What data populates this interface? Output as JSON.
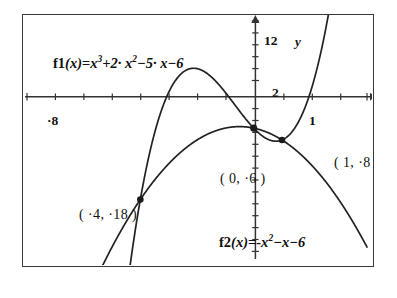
{
  "figure": {
    "background_color": "#ffffff",
    "frame_color": "#3a3a3a",
    "curve_color": "#222222"
  },
  "equations": {
    "f1_name": "f1",
    "f1_arg": "(x)",
    "f1_eq": "=",
    "f1_body_1": "x",
    "f1_body_1_exp": "3",
    "f1_body_2": "+2· x",
    "f1_body_2_exp": "2",
    "f1_body_3": "−5· x−6",
    "f1_plain": "f1(x)=x^3+2·x^2−5·x−6",
    "f2_name": "f2",
    "f2_arg": "(x)",
    "f2_eq": "=",
    "f2_body_1": "-x",
    "f2_body_1_exp": "2",
    "f2_body_2": "−x−6",
    "f2_plain": "f2(x)=-x^2−x−6"
  },
  "axes": {
    "x_name": "x",
    "y_name": "y",
    "x_min_label": "·8",
    "x_max_label": "4",
    "x_one_label": "1",
    "y_max_label": "12",
    "y_two_label": "2",
    "y_min_label": "·28"
  },
  "point_labels": {
    "a": "( ·4, ·18 )",
    "b": "( 0, ·6 )",
    "c": "( 1, ·8 )"
  },
  "chart_data": {
    "type": "line",
    "title": "",
    "xlabel": "x",
    "ylabel": "y",
    "xlim": [
      -8,
      4
    ],
    "ylim": [
      -28,
      12
    ],
    "grid": false,
    "legend": "none",
    "xticks": [
      -8,
      -7,
      -6,
      -5,
      -4,
      -3,
      -2,
      -1,
      0,
      1,
      2,
      3,
      4
    ],
    "xtick_labels_shown": [
      "·8",
      "1",
      "4"
    ],
    "yticks": [
      -28,
      -26,
      -24,
      -22,
      -20,
      -18,
      -16,
      -14,
      -12,
      -10,
      -8,
      -6,
      -4,
      -2,
      0,
      2,
      4,
      6,
      8,
      10,
      12
    ],
    "ytick_labels_shown": [
      "12",
      "2",
      "·28"
    ],
    "series": [
      {
        "name": "f1(x)=x^3+2·x^2−5·x−6",
        "kind": "cubic",
        "coefficients": {
          "a": 1,
          "b": 2,
          "c": -5,
          "d": -6
        },
        "roots": [
          -3,
          -1,
          2
        ],
        "local_max_x": -2.12,
        "local_max_y": 4.061,
        "local_min_x": 0.786,
        "local_min_y": -8.209
      },
      {
        "name": "f2(x)=-x^2−x−6",
        "kind": "quadratic",
        "coefficients": {
          "a": -1,
          "b": -1,
          "c": -6
        },
        "vertex_x": -0.5,
        "vertex_y": -5.75,
        "roots": []
      }
    ],
    "annotations": [
      {
        "label": "( ·4, ·18 )",
        "x": -4,
        "y": -18,
        "marker": true
      },
      {
        "label": "( 0, ·6 )",
        "x": 0,
        "y": -6,
        "marker": true
      },
      {
        "label": "( 1, ·8 )",
        "x": 1,
        "y": -8,
        "marker": true
      }
    ]
  }
}
